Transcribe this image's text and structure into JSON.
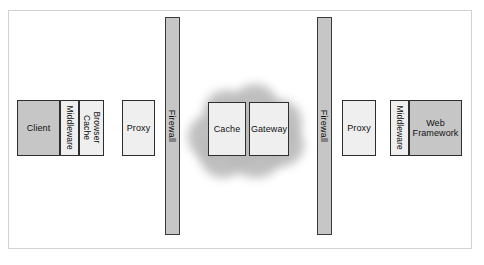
{
  "figure": {
    "type": "architecture-diagram",
    "title": "",
    "background_color": "#ffffff",
    "frame_color": "#d2d2d2"
  },
  "colors": {
    "dark_box_fill": "#c6c6c6",
    "light_box_fill": "#efefef",
    "box_border": "#2e2e2e",
    "firewall_fill": "#c6c6c6",
    "firewall_border": "#3a3a3a",
    "cloud_fill": "#b9b9b9",
    "text": "#111111"
  },
  "nodes": {
    "client": {
      "label": "Client",
      "shade": "dark",
      "orientation": "horizontal"
    },
    "client_middleware": {
      "label": "Middleware",
      "shade": "light",
      "orientation": "vertical"
    },
    "browser_cache": {
      "label": "Browser\nCache",
      "shade": "light",
      "orientation": "vertical"
    },
    "client_proxy": {
      "label": "Proxy",
      "shade": "light",
      "orientation": "horizontal"
    },
    "firewall_left": {
      "label": "Firewall",
      "shade": "dark",
      "orientation": "vertical"
    },
    "cache": {
      "label": "Cache",
      "shade": "light",
      "orientation": "horizontal"
    },
    "gateway": {
      "label": "Gateway",
      "shade": "light",
      "orientation": "horizontal"
    },
    "firewall_right": {
      "label": "Firewall",
      "shade": "dark",
      "orientation": "vertical"
    },
    "server_proxy": {
      "label": "Proxy",
      "shade": "light",
      "orientation": "horizontal"
    },
    "server_middleware": {
      "label": "Middleware",
      "shade": "light",
      "orientation": "vertical"
    },
    "web_framework": {
      "label": "Web\nFramework",
      "shade": "dark",
      "orientation": "horizontal"
    }
  },
  "cloud": {
    "name": "network-cloud",
    "contains": [
      "Cache",
      "Gateway"
    ]
  }
}
